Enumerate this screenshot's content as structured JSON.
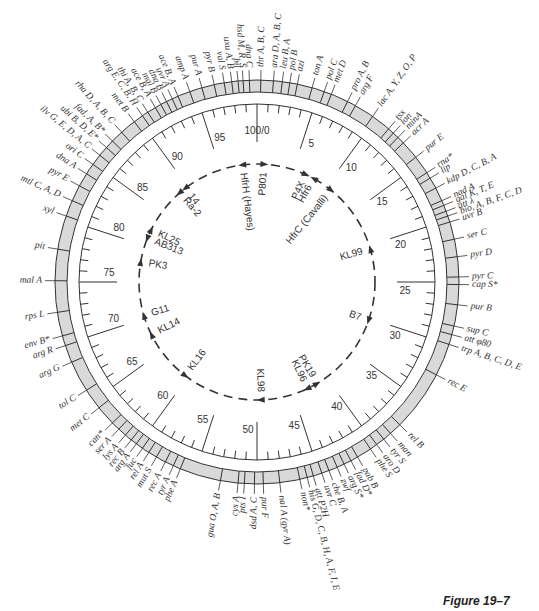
{
  "figure": {
    "caption": "Figure 19–7",
    "center": [
      257,
      282
    ],
    "band_outer_r": 202,
    "band_inner_r": 190,
    "scale_r": 178,
    "colors": {
      "band_fill": "#d9d9d9",
      "ink": "#333333"
    }
  },
  "scale": {
    "total_minutes": 100,
    "labels": [
      {
        "min": 0,
        "text": "100/0"
      },
      {
        "min": 5,
        "text": "5"
      },
      {
        "min": 10,
        "text": "10"
      },
      {
        "min": 15,
        "text": "15"
      },
      {
        "min": 20,
        "text": "20"
      },
      {
        "min": 25,
        "text": "25"
      },
      {
        "min": 30,
        "text": "30"
      },
      {
        "min": 35,
        "text": "35"
      },
      {
        "min": 40,
        "text": "40"
      },
      {
        "min": 45,
        "text": "45"
      },
      {
        "min": 50,
        "text": "50"
      },
      {
        "min": 55,
        "text": "55"
      },
      {
        "min": 60,
        "text": "60"
      },
      {
        "min": 65,
        "text": "65"
      },
      {
        "min": 70,
        "text": "70"
      },
      {
        "min": 75,
        "text": "75"
      },
      {
        "min": 80,
        "text": "80"
      },
      {
        "min": 85,
        "text": "85"
      },
      {
        "min": 90,
        "text": "90"
      },
      {
        "min": 95,
        "text": "95"
      }
    ]
  },
  "genes": [
    {
      "min": 0.3,
      "text": "thr A, B, C"
    },
    {
      "min": 1.3,
      "text": "ara D, A, B, C"
    },
    {
      "min": 2.0,
      "text": "leu B, A"
    },
    {
      "min": 2.6,
      "text": "pol B"
    },
    {
      "min": 3.2,
      "text": "azi"
    },
    {
      "min": 4.4,
      "text": "ton A"
    },
    {
      "min": 5.4,
      "text": "pol C"
    },
    {
      "min": 6.0,
      "text": "met D"
    },
    {
      "min": 7.4,
      "text": "pro A, B"
    },
    {
      "min": 8.1,
      "text": "arg F"
    },
    {
      "min": 9.7,
      "text": "lac A, Y, Z, O, P"
    },
    {
      "min": 11.3,
      "text": "tsx"
    },
    {
      "min": 11.8,
      "text": "lon"
    },
    {
      "min": 12.3,
      "text": "minA"
    },
    {
      "min": 12.9,
      "text": "acr A"
    },
    {
      "min": 14.4,
      "text": "pur E"
    },
    {
      "min": 15.9,
      "text": "rna*"
    },
    {
      "min": 16.4,
      "text": "lip"
    },
    {
      "min": 17.3,
      "text": "kdp D, C, B, A"
    },
    {
      "min": 18.4,
      "text": "nad A"
    },
    {
      "min": 18.8,
      "text": "gal K, T, E"
    },
    {
      "min": 19.3,
      "text": "att λ"
    },
    {
      "min": 19.7,
      "text": "bio, A, B, F, C, D"
    },
    {
      "min": 20.2,
      "text": "uvr B"
    },
    {
      "min": 21.6,
      "text": "ser C"
    },
    {
      "min": 23.0,
      "text": "pyr D"
    },
    {
      "min": 24.6,
      "text": "pyr C"
    },
    {
      "min": 25.2,
      "text": "cap S*"
    },
    {
      "min": 26.8,
      "text": "pur B"
    },
    {
      "min": 28.5,
      "text": "sup C"
    },
    {
      "min": 29.2,
      "text": "att φ80"
    },
    {
      "min": 30.0,
      "text": "trp A, B, C, D, E"
    },
    {
      "min": 32.6,
      "text": "rec E"
    },
    {
      "min": 37.5,
      "text": "rel B"
    },
    {
      "min": 38.5,
      "text": "man"
    },
    {
      "min": 39.2,
      "text": "tyr S"
    },
    {
      "min": 39.9,
      "text": "aro D"
    },
    {
      "min": 40.5,
      "text": "phe S"
    },
    {
      "min": 41.7,
      "text": "pab B"
    },
    {
      "min": 42.3,
      "text": "fad D*"
    },
    {
      "min": 42.9,
      "text": "arg S*"
    },
    {
      "min": 43.5,
      "text": "zwf"
    },
    {
      "min": 44.2,
      "text": "che B, A"
    },
    {
      "min": 44.8,
      "text": "uvr C"
    },
    {
      "min": 45.5,
      "text": "att P2H"
    },
    {
      "min": 46.0,
      "text": "his G, D, C, B, H, A, F, I, E"
    },
    {
      "min": 46.6,
      "text": "non*"
    },
    {
      "min": 48.2,
      "text": "nal A (gyr A)"
    },
    {
      "min": 49.5,
      "text": "pur F"
    },
    {
      "min": 50.2,
      "text": "dsd A, C"
    },
    {
      "min": 51.0,
      "text": "pts I"
    },
    {
      "min": 51.5,
      "text": "cys A"
    },
    {
      "min": 52.9,
      "text": "gua O, A, B"
    },
    {
      "min": 56.2,
      "text": "phe A"
    },
    {
      "min": 56.8,
      "text": "tyr A"
    },
    {
      "min": 57.5,
      "text": "rec A"
    },
    {
      "min": 58.3,
      "text": "mut S"
    },
    {
      "min": 59.0,
      "text": "rel A"
    },
    {
      "min": 59.6,
      "text": "fuc"
    },
    {
      "min": 60.2,
      "text": "arg A"
    },
    {
      "min": 60.7,
      "text": "rec B"
    },
    {
      "min": 61.3,
      "text": "lys A"
    },
    {
      "min": 62.0,
      "text": "ser A"
    },
    {
      "min": 62.7,
      "text": "can*"
    },
    {
      "min": 64.3,
      "text": "met C"
    },
    {
      "min": 66.0,
      "text": "tol C"
    },
    {
      "min": 68.5,
      "text": "arg G"
    },
    {
      "min": 69.9,
      "text": "arg R"
    },
    {
      "min": 70.7,
      "text": "env B*"
    },
    {
      "min": 72.6,
      "text": "rps L"
    },
    {
      "min": 75.1,
      "text": "mal A"
    },
    {
      "min": 77.6,
      "text": "pit"
    },
    {
      "min": 80.3,
      "text": "xyl"
    },
    {
      "min": 81.6,
      "text": "mtl C, A, D"
    },
    {
      "min": 82.9,
      "text": "pyr E"
    },
    {
      "min": 84.0,
      "text": "dna A"
    },
    {
      "min": 84.9,
      "text": "ori C"
    },
    {
      "min": 85.8,
      "text": "ilv G, E, D, A, C"
    },
    {
      "min": 86.6,
      "text": "ubi B, D, E*"
    },
    {
      "min": 87.3,
      "text": "fad, A, B*"
    },
    {
      "min": 88.3,
      "text": "rha D, A, B, C"
    },
    {
      "min": 89.6,
      "text": "met B"
    },
    {
      "min": 90.4,
      "text": "arg E, C, B, H"
    },
    {
      "min": 90.9,
      "text": "thi A, B, C"
    },
    {
      "min": 91.6,
      "text": "ace B, A"
    },
    {
      "min": 92.1,
      "text": "mal B"
    },
    {
      "min": 92.6,
      "text": "dna B"
    },
    {
      "min": 93.1,
      "text": "uvr A"
    },
    {
      "min": 93.6,
      "text": "ace B, A"
    },
    {
      "min": 94.6,
      "text": "amp A"
    },
    {
      "min": 95.6,
      "text": "pur A"
    },
    {
      "min": 96.6,
      "text": "pyr B"
    },
    {
      "min": 97.4,
      "text": "val S"
    },
    {
      "min": 98.0,
      "text": "uxu A, B"
    },
    {
      "min": 98.5,
      "text": "pil"
    },
    {
      "min": 98.9,
      "text": "hsd M, R, S"
    },
    {
      "min": 99.4,
      "text": "dna C"
    }
  ],
  "band_dividers": [
    0.3,
    1.3,
    2.0,
    2.6,
    3.2,
    4.4,
    5.4,
    6.0,
    7.4,
    8.1,
    9.7,
    11.3,
    11.8,
    12.3,
    12.9,
    14.4,
    15.9,
    16.4,
    17.3,
    18.4,
    18.8,
    19.3,
    19.7,
    20.2,
    21.6,
    23.0,
    24.6,
    25.2,
    26.8,
    28.5,
    29.2,
    30.0,
    32.6,
    37.5,
    38.5,
    39.2,
    39.9,
    40.5,
    41.7,
    42.3,
    42.9,
    43.5,
    44.2,
    44.8,
    45.5,
    46.0,
    46.6,
    48.2,
    49.5,
    50.2,
    51.0,
    51.5,
    52.9,
    56.2,
    56.8,
    57.5,
    58.3,
    59.0,
    59.6,
    60.2,
    60.7,
    61.3,
    62.0,
    62.7,
    64.3,
    66.0,
    68.5,
    69.9,
    70.7,
    72.6,
    75.1,
    77.6,
    80.3,
    81.6,
    82.9,
    84.0,
    84.9,
    85.8,
    86.6,
    87.3,
    88.3,
    89.6,
    90.4,
    90.9,
    91.6,
    92.1,
    92.6,
    93.1,
    93.6,
    94.6,
    95.6,
    96.6,
    97.4,
    98.0,
    98.5,
    98.9,
    99.4
  ],
  "hfr_strains": [
    {
      "min": 98.0,
      "text": "HfrH (Hayes)",
      "dir": "ccw"
    },
    {
      "min": 1.0,
      "text": "P801",
      "dir": "cw"
    },
    {
      "min": 6.8,
      "text": "P4X",
      "dir": "cw"
    },
    {
      "min": 8.0,
      "text": "Hfr6",
      "dir": "ccw"
    },
    {
      "min": 10.8,
      "text": "HfrC (Cavalli)",
      "dir": "cw"
    },
    {
      "min": 20.5,
      "text": "KL99",
      "dir": "ccw"
    },
    {
      "min": 30.3,
      "text": "B7",
      "dir": "cw"
    },
    {
      "min": 41.5,
      "text": "PK19",
      "dir": "ccw"
    },
    {
      "min": 43.0,
      "text": "KL96",
      "dir": "cw"
    },
    {
      "min": 49.5,
      "text": "KL98",
      "dir": "cw"
    },
    {
      "min": 60.4,
      "text": "KL16",
      "dir": "ccw"
    },
    {
      "min": 67.6,
      "text": "KL14",
      "dir": "cw"
    },
    {
      "min": 70.4,
      "text": "G11",
      "dir": "cw"
    },
    {
      "min": 77.7,
      "text": "PK3",
      "dir": "cw"
    },
    {
      "min": 81.0,
      "text": "AB313",
      "dir": "ccw"
    },
    {
      "min": 82.3,
      "text": "KL25",
      "dir": "cw"
    },
    {
      "min": 88.6,
      "text": "Ra-2",
      "dir": "ccw"
    },
    {
      "min": 89.6,
      "text": "14",
      "dir": "ccw"
    }
  ]
}
